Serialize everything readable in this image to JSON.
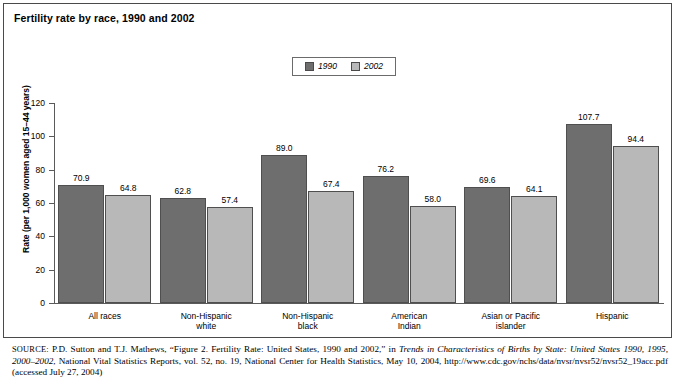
{
  "title": "Fertility rate by race, 1990 and 2002",
  "legend": {
    "position": "top-center",
    "entries": [
      {
        "label": "1990",
        "color": "#6e6e6e"
      },
      {
        "label": "2002",
        "color": "#b8b8b8"
      }
    ]
  },
  "axes": {
    "ylabel": "Rate (per 1,000 women aged 15–44 years)",
    "yticks": [
      "0",
      "20",
      "40",
      "60",
      "80",
      "100",
      "120"
    ]
  },
  "source": {
    "prefix": "SOURCE:",
    "text_1": " P.D. Sutton and T.J. Mathews, “Figure 2. Fertility Rate: United States, 1990 and 2002,” in ",
    "italic_1": "Trends in Characteristics of Births by State: United States 1990, 1995, 2000–2002",
    "text_2": ", National Vital Statistics Reports, vol. 52, no. 19, National Center for Health Statistics, May 10, 2004, http://www.cdc.gov/nchs/data/nvsr/nvsr52/nvsr52_19acc.pdf (accessed July 27, 2004)"
  },
  "chart_data": {
    "type": "bar",
    "title": "Fertility rate by race, 1990 and 2002",
    "xlabel": "",
    "ylabel": "Rate (per 1,000 women aged 15–44 years)",
    "ylim": [
      0,
      120
    ],
    "ytick_step": 20,
    "grid": false,
    "legend_position": "top-center",
    "categories": [
      "All races",
      "Non-Hispanic white",
      "Non-Hispanic black",
      "American Indian",
      "Asian or Pacific islander",
      "Hispanic"
    ],
    "category_lines": [
      [
        "All races"
      ],
      [
        "Non-Hispanic",
        "white"
      ],
      [
        "Non-Hispanic",
        "black"
      ],
      [
        "American",
        "Indian"
      ],
      [
        "Asian or Pacific",
        "islander"
      ],
      [
        "Hispanic"
      ]
    ],
    "series": [
      {
        "name": "1990",
        "color": "#6e6e6e",
        "values": [
          70.9,
          62.8,
          89.0,
          76.2,
          69.6,
          107.7
        ]
      },
      {
        "name": "2002",
        "color": "#b8b8b8",
        "values": [
          64.8,
          57.4,
          67.4,
          58.0,
          64.1,
          94.4
        ]
      }
    ]
  }
}
